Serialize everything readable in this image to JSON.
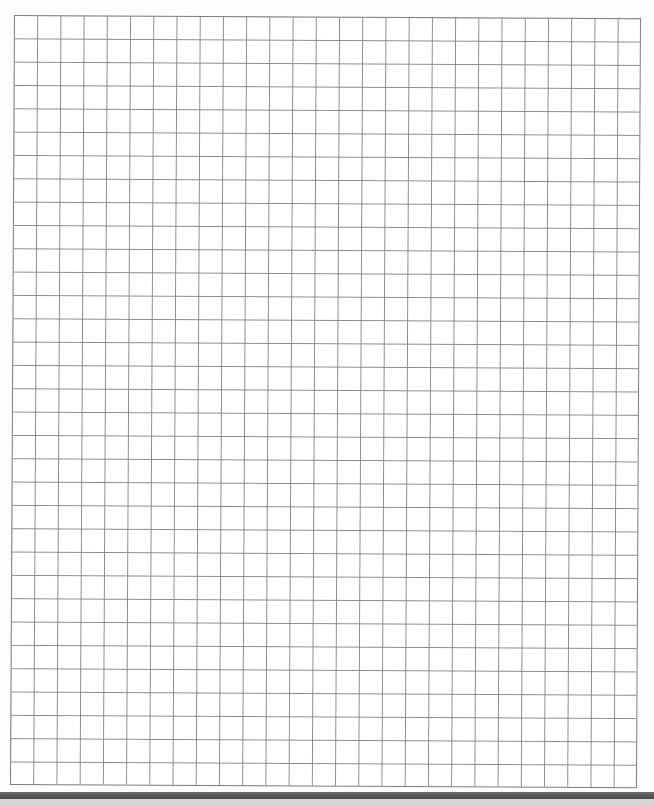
{
  "document": {
    "type": "graph-paper",
    "grid": {
      "columns": 27,
      "rows": 33,
      "cell_width_px": 23.22,
      "cell_height_px": 23.33,
      "origin": [
        14,
        15
      ],
      "line_color": "#8a8a8a",
      "border_color": "#7d7d7d",
      "background": "#ffffff"
    },
    "footer": {
      "dark_bar_color": "#555555",
      "light_bar_color": "#d6d6d6"
    }
  }
}
